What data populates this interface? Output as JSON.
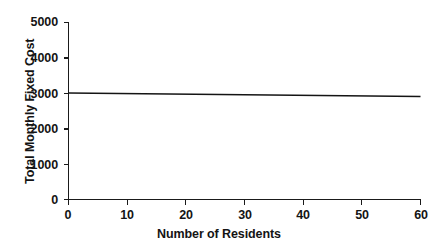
{
  "chart_data": {
    "type": "line",
    "title": "",
    "xlabel": "Number of Residents",
    "ylabel": "Total Monthly Fixed Cost",
    "xlim": [
      0,
      60
    ],
    "ylim": [
      0,
      5000
    ],
    "xticks": [
      "0",
      "10",
      "20",
      "30",
      "40",
      "50",
      "60"
    ],
    "yticks": [
      "0",
      "1000",
      "2000",
      "3000",
      "4000",
      "5000"
    ],
    "grid": false,
    "legend": null,
    "series": [
      {
        "name": "Total Monthly Fixed Cost",
        "color": "#141414",
        "x": [
          0,
          60
        ],
        "values": [
          3000,
          2900
        ]
      }
    ],
    "annotations": []
  },
  "axes": {
    "y": {
      "label": "Total Monthly Fixed Cost",
      "ticks": [
        {
          "value": "5000",
          "pos": 5000
        },
        {
          "value": "4000",
          "pos": 4000
        },
        {
          "value": "3000",
          "pos": 3000
        },
        {
          "value": "2000",
          "pos": 2000
        },
        {
          "value": "1000",
          "pos": 1000
        },
        {
          "value": "0",
          "pos": 0
        }
      ]
    },
    "x": {
      "label": "Number of Residents",
      "ticks": [
        {
          "value": "0",
          "pos": 0
        },
        {
          "value": "10",
          "pos": 10
        },
        {
          "value": "20",
          "pos": 20
        },
        {
          "value": "30",
          "pos": 30
        },
        {
          "value": "40",
          "pos": 40
        },
        {
          "value": "50",
          "pos": 50
        },
        {
          "value": "60",
          "pos": 60
        }
      ]
    }
  }
}
